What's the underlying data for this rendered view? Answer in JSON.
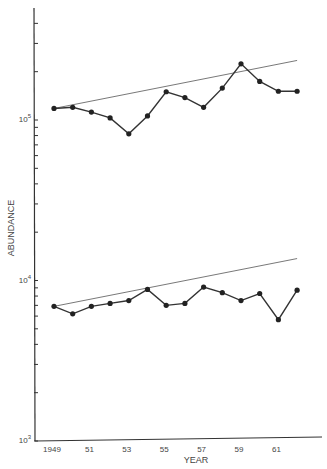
{
  "chart_data": {
    "type": "line",
    "title": "",
    "xlabel": "YEAR",
    "ylabel": "ABUNDANCE",
    "yscale": "log",
    "ylim": [
      1000,
      700000
    ],
    "xlim": [
      1948,
      1963
    ],
    "x_tick_labels": [
      "1949",
      "51",
      "53",
      "55",
      "57",
      "59",
      "61"
    ],
    "x_tick_years": [
      1949,
      1951,
      1953,
      1955,
      1957,
      1959,
      1961
    ],
    "y_tick_labels": [
      {
        "base": "10",
        "exp": "3",
        "value": 1000
      },
      {
        "base": "10",
        "exp": "4",
        "value": 10000
      },
      {
        "base": "10",
        "exp": "5",
        "value": 100000
      }
    ],
    "grid": false,
    "legend": null,
    "x": [
      1949,
      1950,
      1951,
      1952,
      1953,
      1954,
      1955,
      1956,
      1957,
      1958,
      1959,
      1960,
      1961,
      1962
    ],
    "series": [
      {
        "name": "upper",
        "values": [
          118000,
          120000,
          112000,
          103000,
          82000,
          106000,
          150000,
          138000,
          120000,
          158000,
          224000,
          174000,
          151000,
          151000
        ],
        "trend": {
          "start": [
            1949,
            118000
          ],
          "end": [
            1962,
            235000
          ]
        }
      },
      {
        "name": "lower",
        "values": [
          6900,
          6200,
          6900,
          7200,
          7500,
          8800,
          7000,
          7200,
          9100,
          8400,
          7500,
          8300,
          5700,
          8700
        ],
        "trend": {
          "start": [
            1949,
            6900
          ],
          "end": [
            1962,
            13700
          ]
        }
      }
    ]
  }
}
